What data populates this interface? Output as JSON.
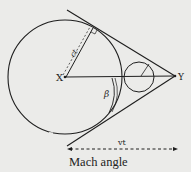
{
  "diagram": {
    "type": "geometry",
    "title": "Mach angle",
    "points": {
      "x": {
        "label": "X",
        "cx": 65,
        "cy": 77
      },
      "y": {
        "label": "Y",
        "cx": 175,
        "cy": 76
      }
    },
    "labels": {
      "radius": "ct",
      "distance": "vt",
      "angle": "β",
      "caption": "Mach angle"
    },
    "colors": {
      "background": "#ebebe9",
      "ink": "#1e1e1e"
    }
  }
}
